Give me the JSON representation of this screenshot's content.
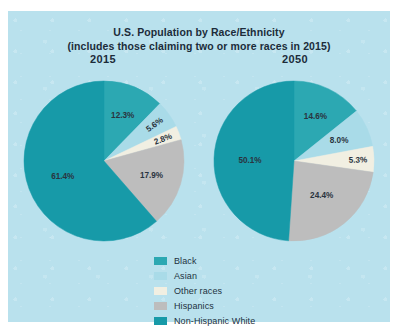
{
  "page": {
    "bleed_text": "· ·        ·           ·        ·",
    "panel_bg": "#b9e1ed"
  },
  "chart_data": {
    "type": "pie",
    "title": "U.S. Population by Race/Ethnicity",
    "subtitle": "(includes those claiming two or more races in 2015)",
    "categories": [
      "Black",
      "Asian",
      "Other races",
      "Hispanics",
      "Non-Hispanic White"
    ],
    "colors": [
      "#2ca8b2",
      "#a9dbe8",
      "#f1efe2",
      "#bdbdbd",
      "#179aa8"
    ],
    "legend_position": "bottom-center",
    "grid": false,
    "start_angle_deg": 0,
    "direction": "clockwise",
    "series": [
      {
        "name": "2015",
        "values": [
          12.3,
          5.6,
          2.8,
          17.9,
          61.4
        ],
        "labels": [
          "12.3%",
          "5.6%",
          "2.8%",
          "17.9%",
          "61.4%"
        ]
      },
      {
        "name": "2050",
        "values": [
          14.6,
          8.0,
          5.3,
          24.4,
          50.1
        ],
        "labels": [
          "14.6%",
          "8.0%",
          "5.3%",
          "24.4%",
          "50.1%"
        ]
      }
    ]
  },
  "legend": {
    "items": [
      {
        "label": "Black",
        "color": "#2ca8b2"
      },
      {
        "label": "Asian",
        "color": "#a9dbe8"
      },
      {
        "label": "Other races",
        "color": "#f1efe2"
      },
      {
        "label": "Hispanics",
        "color": "#bdbdbd"
      },
      {
        "label": "Non-Hispanic White",
        "color": "#179aa8"
      }
    ]
  }
}
